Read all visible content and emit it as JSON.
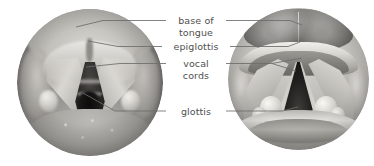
{
  "figure": {
    "background_color": "#ffffff",
    "label_color": "#4f4f4f",
    "leader_line_color": "#6d6d6d",
    "panels": [
      {
        "id": "photo-panel",
        "kind": "endoscopic-photograph",
        "caption": "Endoscopic photograph of the larynx",
        "shape": "circle",
        "rendering": "grayscale"
      },
      {
        "id": "illus-panel",
        "kind": "anatomical-illustration",
        "caption": "Anatomical illustration of the larynx",
        "shape": "circle",
        "rendering": "grayscale"
      }
    ]
  },
  "labels": {
    "base_of_tongue": "base of\ntongue",
    "epiglottis": "epiglottis",
    "vocal_cords": "vocal\ncords",
    "glottis": "glottis"
  },
  "structures": [
    {
      "name": "base of tongue",
      "label_key": "base_of_tongue"
    },
    {
      "name": "epiglottis",
      "label_key": "epiglottis"
    },
    {
      "name": "vocal cords",
      "label_key": "vocal_cords"
    },
    {
      "name": "glottis",
      "label_key": "glottis"
    }
  ]
}
